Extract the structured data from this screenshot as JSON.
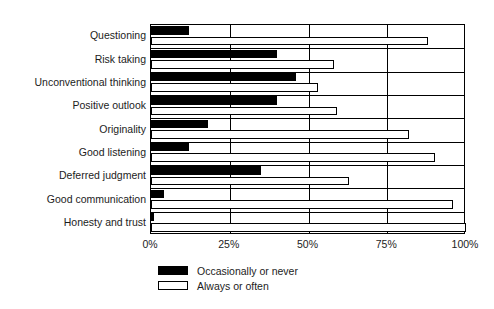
{
  "chart_data": {
    "type": "bar",
    "orientation": "horizontal",
    "title": "",
    "xlabel": "",
    "ylabel": "",
    "xlim": [
      0,
      100
    ],
    "xticks": [
      "0%",
      "25%",
      "50%",
      "75%",
      "100%"
    ],
    "xtick_values": [
      0,
      25,
      50,
      75,
      100
    ],
    "grid": true,
    "legend_position": "bottom-left",
    "categories": [
      "Questioning",
      "Risk taking",
      "Unconventional thinking",
      "Positive outlook",
      "Originality",
      "Good listening",
      "Deferred judgment",
      "Good communication",
      "Honesty and trust"
    ],
    "series": [
      {
        "name": "Occasionally or never",
        "color": "#000000",
        "values": [
          12,
          40,
          46,
          40,
          18,
          12,
          35,
          4,
          1
        ]
      },
      {
        "name": "Always or often",
        "color": "#ffffff",
        "values": [
          88,
          58,
          53,
          59,
          82,
          90,
          63,
          96,
          100
        ]
      }
    ]
  },
  "legend": {
    "items": [
      {
        "label": "Occasionally or never",
        "swatch": "dark"
      },
      {
        "label": "Always or often",
        "swatch": "light"
      }
    ]
  },
  "colors": {
    "bar_dark": "#000000",
    "bar_light": "#ffffff",
    "axis": "#000000",
    "text": "#1c1c1c",
    "background": "#ffffff"
  }
}
